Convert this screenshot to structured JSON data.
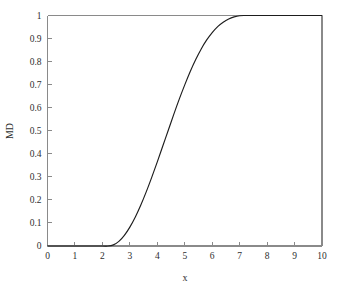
{
  "chart_data": {
    "type": "line",
    "title": "",
    "subtitle": "",
    "xlabel": "x",
    "ylabel": "MD",
    "xlim": [
      0,
      10
    ],
    "ylim": [
      0,
      1
    ],
    "grid": false,
    "legend": null,
    "legend_position": "none",
    "x_ticks": [
      0,
      1,
      2,
      3,
      4,
      5,
      6,
      7,
      8,
      9,
      10
    ],
    "x_tick_labels": [
      "0",
      "1",
      "2",
      "3",
      "4",
      "5",
      "6",
      "7",
      "8",
      "9",
      "10"
    ],
    "y_ticks": [
      0,
      0.1,
      0.2,
      0.3,
      0.4,
      0.5,
      0.6,
      0.7,
      0.8,
      0.9,
      1
    ],
    "y_tick_labels": [
      "0",
      "0.1",
      "0.2",
      "0.3",
      "0.4",
      "0.5",
      "0.6",
      "0.7",
      "0.8",
      "0.9",
      "1"
    ],
    "series": [
      {
        "name": "MD",
        "color": "#1d1d1d",
        "x": [
          0,
          0.5,
          1,
          1.5,
          2,
          2.2,
          2.4,
          2.6,
          2.8,
          3,
          3.2,
          3.4,
          3.6,
          3.8,
          4,
          4.2,
          4.4,
          4.6,
          4.8,
          5,
          5.2,
          5.4,
          5.6,
          5.8,
          6,
          6.2,
          6.4,
          6.6,
          6.8,
          7,
          7.2,
          7.4,
          7.6,
          7.8,
          8,
          8.5,
          9,
          9.5,
          10
        ],
        "values": [
          0,
          0,
          0,
          0,
          0,
          0,
          0.005,
          0.02,
          0.046,
          0.082,
          0.126,
          0.178,
          0.236,
          0.299,
          0.365,
          0.434,
          0.502,
          0.571,
          0.637,
          0.699,
          0.757,
          0.809,
          0.855,
          0.894,
          0.926,
          0.952,
          0.971,
          0.985,
          0.994,
          0.999,
          1,
          1,
          1,
          1,
          1,
          1,
          1,
          1,
          1
        ]
      }
    ]
  },
  "axes": {
    "x_axis_name": "x-axis",
    "y_axis_name": "y-axis"
  }
}
